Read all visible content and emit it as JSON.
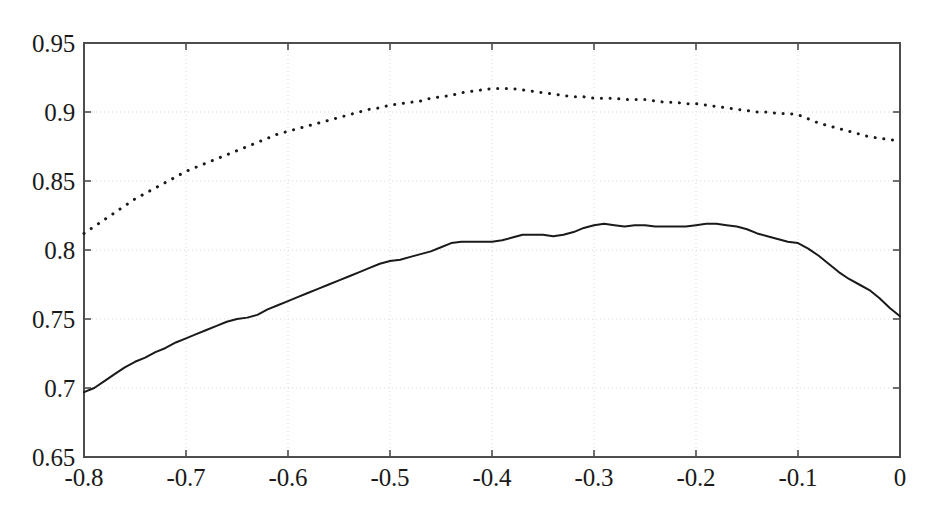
{
  "chart_data": {
    "type": "line",
    "title": "",
    "subtitle": "",
    "xlabel": "",
    "ylabel": "",
    "xlim": [
      -0.8,
      0.0
    ],
    "ylim": [
      0.65,
      0.95
    ],
    "xticks": [
      -0.8,
      -0.7,
      -0.6,
      -0.5,
      -0.4,
      -0.3,
      -0.2,
      -0.1,
      0
    ],
    "xticklabels": [
      "-0.8",
      "-0.7",
      "-0.6",
      "-0.5",
      "-0.4",
      "-0.3",
      "-0.2",
      "-0.1",
      "0"
    ],
    "yticks": [
      0.65,
      0.7,
      0.75,
      0.8,
      0.85,
      0.9,
      0.95
    ],
    "yticklabels": [
      "0.65",
      "0.7",
      "0.75",
      "0.8",
      "0.85",
      "0.9",
      "0.95"
    ],
    "grid": true,
    "grid_style": "dotted",
    "grid_color": "#d8d8d8",
    "legend": null,
    "legend_position": "none",
    "axis_color": "#4d4d4d",
    "background_color": "#ffffff",
    "series": [
      {
        "name": "solid-curve",
        "style": "solid",
        "color": "#1a1a1a",
        "linewidth": 2.0,
        "x": [
          -0.8,
          -0.79,
          -0.78,
          -0.77,
          -0.76,
          -0.75,
          -0.74,
          -0.73,
          -0.72,
          -0.71,
          -0.7,
          -0.69,
          -0.68,
          -0.67,
          -0.66,
          -0.65,
          -0.64,
          -0.63,
          -0.62,
          -0.61,
          -0.6,
          -0.59,
          -0.58,
          -0.57,
          -0.56,
          -0.55,
          -0.54,
          -0.53,
          -0.52,
          -0.51,
          -0.5,
          -0.49,
          -0.48,
          -0.47,
          -0.46,
          -0.45,
          -0.44,
          -0.43,
          -0.42,
          -0.41,
          -0.4,
          -0.39,
          -0.38,
          -0.37,
          -0.36,
          -0.35,
          -0.34,
          -0.33,
          -0.32,
          -0.31,
          -0.3,
          -0.29,
          -0.28,
          -0.27,
          -0.26,
          -0.25,
          -0.24,
          -0.23,
          -0.22,
          -0.21,
          -0.2,
          -0.19,
          -0.18,
          -0.17,
          -0.16,
          -0.15,
          -0.14,
          -0.13,
          -0.12,
          -0.11,
          -0.1,
          -0.09,
          -0.08,
          -0.07,
          -0.06,
          -0.05,
          -0.04,
          -0.03,
          -0.02,
          -0.01,
          0.0
        ],
        "y": [
          0.697,
          0.7,
          0.705,
          0.71,
          0.715,
          0.719,
          0.722,
          0.726,
          0.729,
          0.733,
          0.736,
          0.739,
          0.742,
          0.745,
          0.748,
          0.75,
          0.751,
          0.753,
          0.757,
          0.76,
          0.763,
          0.766,
          0.769,
          0.772,
          0.775,
          0.778,
          0.781,
          0.784,
          0.787,
          0.79,
          0.792,
          0.793,
          0.795,
          0.797,
          0.799,
          0.802,
          0.805,
          0.806,
          0.806,
          0.806,
          0.806,
          0.807,
          0.809,
          0.811,
          0.811,
          0.811,
          0.81,
          0.811,
          0.813,
          0.816,
          0.818,
          0.819,
          0.818,
          0.817,
          0.818,
          0.818,
          0.817,
          0.817,
          0.817,
          0.817,
          0.818,
          0.819,
          0.819,
          0.818,
          0.817,
          0.815,
          0.812,
          0.81,
          0.808,
          0.806,
          0.805,
          0.801,
          0.796,
          0.79,
          0.784,
          0.779,
          0.775,
          0.771,
          0.765,
          0.758,
          0.752
        ]
      },
      {
        "name": "dotted-curve",
        "style": "dotted",
        "color": "#1a1a1a",
        "linewidth": 3.0,
        "x": [
          -0.8,
          -0.79,
          -0.78,
          -0.77,
          -0.76,
          -0.75,
          -0.74,
          -0.73,
          -0.72,
          -0.71,
          -0.7,
          -0.69,
          -0.68,
          -0.67,
          -0.66,
          -0.65,
          -0.64,
          -0.63,
          -0.62,
          -0.61,
          -0.6,
          -0.59,
          -0.58,
          -0.57,
          -0.56,
          -0.55,
          -0.54,
          -0.53,
          -0.52,
          -0.51,
          -0.5,
          -0.49,
          -0.48,
          -0.47,
          -0.46,
          -0.45,
          -0.44,
          -0.43,
          -0.42,
          -0.41,
          -0.4,
          -0.39,
          -0.38,
          -0.37,
          -0.36,
          -0.35,
          -0.34,
          -0.33,
          -0.32,
          -0.31,
          -0.3,
          -0.29,
          -0.28,
          -0.27,
          -0.26,
          -0.25,
          -0.24,
          -0.23,
          -0.22,
          -0.21,
          -0.2,
          -0.19,
          -0.18,
          -0.17,
          -0.16,
          -0.15,
          -0.14,
          -0.13,
          -0.12,
          -0.11,
          -0.1,
          -0.09,
          -0.08,
          -0.07,
          -0.06,
          -0.05,
          -0.04,
          -0.03,
          -0.02,
          -0.01,
          0.0
        ],
        "y": [
          0.812,
          0.817,
          0.822,
          0.827,
          0.832,
          0.837,
          0.841,
          0.845,
          0.849,
          0.853,
          0.857,
          0.86,
          0.863,
          0.866,
          0.869,
          0.872,
          0.875,
          0.878,
          0.881,
          0.884,
          0.886,
          0.888,
          0.89,
          0.892,
          0.894,
          0.896,
          0.898,
          0.9,
          0.902,
          0.903,
          0.905,
          0.906,
          0.907,
          0.908,
          0.91,
          0.911,
          0.912,
          0.914,
          0.915,
          0.916,
          0.917,
          0.917,
          0.917,
          0.916,
          0.915,
          0.914,
          0.913,
          0.912,
          0.911,
          0.911,
          0.91,
          0.91,
          0.91,
          0.909,
          0.909,
          0.909,
          0.908,
          0.907,
          0.907,
          0.906,
          0.906,
          0.905,
          0.904,
          0.903,
          0.902,
          0.901,
          0.9,
          0.9,
          0.899,
          0.899,
          0.898,
          0.895,
          0.892,
          0.89,
          0.888,
          0.886,
          0.884,
          0.882,
          0.881,
          0.88,
          0.879
        ]
      }
    ]
  },
  "axes": {
    "frame": {
      "left": 84,
      "right": 900,
      "top": 43,
      "bottom": 457
    }
  }
}
